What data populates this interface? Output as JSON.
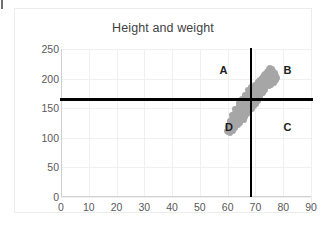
{
  "chart_data": {
    "type": "scatter",
    "title": "Height and weight",
    "xlabel": "",
    "ylabel": "",
    "xlim": [
      0,
      90
    ],
    "ylim": [
      0,
      250
    ],
    "xticks": [
      0,
      10,
      20,
      30,
      40,
      50,
      60,
      70,
      80,
      90
    ],
    "yticks": [
      0,
      50,
      100,
      150,
      200,
      250
    ],
    "grid": true,
    "legend": false,
    "marker_color": "#a6a6a6",
    "reference_lines": [
      {
        "orientation": "vertical",
        "value": 68.5,
        "color": "#000000",
        "label": "height mean"
      },
      {
        "orientation": "horizontal",
        "value": 165,
        "color": "#000000",
        "label": "weight mean"
      }
    ],
    "annotations": [
      {
        "label": "A",
        "x": 58.5,
        "y": 214,
        "quadrant": "top-left"
      },
      {
        "label": "B",
        "x": 81.5,
        "y": 214,
        "quadrant": "top-right"
      },
      {
        "label": "C",
        "x": 81.5,
        "y": 118,
        "quadrant": "bottom-right"
      },
      {
        "label": "D",
        "x": 60.5,
        "y": 118,
        "quadrant": "bottom-left"
      }
    ],
    "series": [
      {
        "name": "people",
        "points": [
          [
            59.6,
            112
          ],
          [
            60.1,
            110
          ],
          [
            60.4,
            116
          ],
          [
            60.9,
            113
          ],
          [
            60.6,
            120
          ],
          [
            61.2,
            118
          ],
          [
            61.5,
            123
          ],
          [
            61.0,
            126
          ],
          [
            61.8,
            121
          ],
          [
            62.1,
            127
          ],
          [
            61.6,
            131
          ],
          [
            62.4,
            130
          ],
          [
            62.0,
            135
          ],
          [
            62.8,
            133
          ],
          [
            62.3,
            138
          ],
          [
            63.0,
            137
          ],
          [
            62.6,
            142
          ],
          [
            63.4,
            140
          ],
          [
            63.1,
            145
          ],
          [
            63.8,
            143
          ],
          [
            63.3,
            148
          ],
          [
            64.0,
            147
          ],
          [
            63.6,
            151
          ],
          [
            64.3,
            150
          ],
          [
            64.7,
            146
          ],
          [
            64.1,
            154
          ],
          [
            64.9,
            152
          ],
          [
            64.5,
            157
          ],
          [
            65.2,
            155
          ],
          [
            65.6,
            151
          ],
          [
            65.0,
            160
          ],
          [
            65.8,
            158
          ],
          [
            65.4,
            163
          ],
          [
            66.1,
            161
          ],
          [
            66.5,
            157
          ],
          [
            65.9,
            166
          ],
          [
            66.7,
            164
          ],
          [
            66.3,
            168
          ],
          [
            67.0,
            166
          ],
          [
            67.4,
            162
          ],
          [
            66.8,
            171
          ],
          [
            67.6,
            169
          ],
          [
            67.2,
            173
          ],
          [
            67.9,
            171
          ],
          [
            68.3,
            167
          ],
          [
            67.7,
            176
          ],
          [
            68.5,
            174
          ],
          [
            68.1,
            178
          ],
          [
            68.8,
            176
          ],
          [
            69.2,
            172
          ],
          [
            68.6,
            181
          ],
          [
            69.4,
            179
          ],
          [
            69.0,
            183
          ],
          [
            69.7,
            181
          ],
          [
            70.1,
            177
          ],
          [
            69.5,
            186
          ],
          [
            70.3,
            184
          ],
          [
            69.9,
            188
          ],
          [
            70.6,
            186
          ],
          [
            71.0,
            182
          ],
          [
            70.4,
            191
          ],
          [
            71.2,
            189
          ],
          [
            70.8,
            193
          ],
          [
            71.5,
            191
          ],
          [
            71.9,
            187
          ],
          [
            71.3,
            196
          ],
          [
            72.1,
            194
          ],
          [
            71.7,
            198
          ],
          [
            72.4,
            196
          ],
          [
            72.8,
            192
          ],
          [
            72.2,
            201
          ],
          [
            73.0,
            199
          ],
          [
            72.6,
            203
          ],
          [
            73.3,
            201
          ],
          [
            73.7,
            197
          ],
          [
            73.1,
            206
          ],
          [
            73.9,
            204
          ],
          [
            73.5,
            208
          ],
          [
            74.2,
            206
          ],
          [
            74.6,
            202
          ],
          [
            74.0,
            211
          ],
          [
            74.8,
            209
          ],
          [
            74.4,
            213
          ],
          [
            75.1,
            211
          ],
          [
            75.5,
            207
          ],
          [
            74.9,
            216
          ],
          [
            75.7,
            214
          ],
          [
            75.3,
            218
          ],
          [
            76.0,
            216
          ],
          [
            76.4,
            212
          ],
          [
            76.9,
            210
          ],
          [
            77.3,
            205
          ],
          [
            77.8,
            201
          ],
          [
            76.2,
            207
          ],
          [
            75.0,
            203
          ],
          [
            73.8,
            190
          ],
          [
            72.5,
            186
          ],
          [
            71.1,
            175
          ],
          [
            70.0,
            170
          ],
          [
            68.9,
            165
          ],
          [
            67.5,
            158
          ],
          [
            66.2,
            150
          ],
          [
            65.1,
            143
          ],
          [
            64.4,
            136
          ],
          [
            63.2,
            129
          ],
          [
            62.2,
            122
          ],
          [
            61.1,
            117
          ],
          [
            60.2,
            119
          ],
          [
            62.9,
            126
          ],
          [
            64.8,
            139
          ],
          [
            66.9,
            153
          ],
          [
            68.2,
            160
          ],
          [
            69.8,
            168
          ],
          [
            71.4,
            180
          ],
          [
            72.9,
            188
          ],
          [
            74.5,
            198
          ],
          [
            76.1,
            205
          ],
          [
            77.0,
            208
          ],
          [
            75.9,
            200
          ],
          [
            74.1,
            194
          ],
          [
            72.0,
            183
          ],
          [
            70.5,
            174
          ],
          [
            69.1,
            164
          ],
          [
            67.1,
            152
          ],
          [
            65.5,
            141
          ],
          [
            63.9,
            132
          ],
          [
            62.5,
            124
          ],
          [
            61.4,
            115
          ],
          [
            60.7,
            108
          ],
          [
            61.9,
            112
          ],
          [
            63.5,
            125
          ],
          [
            65.3,
            134
          ],
          [
            67.3,
            147
          ],
          [
            69.3,
            159
          ],
          [
            71.6,
            172
          ],
          [
            73.4,
            185
          ],
          [
            75.4,
            196
          ],
          [
            76.6,
            202
          ],
          [
            77.5,
            197
          ],
          [
            76.8,
            193
          ],
          [
            75.6,
            190
          ],
          [
            74.7,
            187
          ],
          [
            73.6,
            181
          ],
          [
            72.7,
            176
          ],
          [
            71.8,
            169
          ],
          [
            70.9,
            163
          ],
          [
            70.2,
            157
          ],
          [
            69.6,
            153
          ],
          [
            68.7,
            149
          ],
          [
            67.8,
            144
          ],
          [
            67.0,
            140
          ],
          [
            66.4,
            135
          ],
          [
            65.7,
            130
          ],
          [
            64.6,
            125
          ],
          [
            63.7,
            121
          ],
          [
            62.7,
            117
          ],
          [
            61.7,
            113
          ],
          [
            60.5,
            111
          ],
          [
            68.0,
            155
          ],
          [
            69.0,
            161
          ],
          [
            70.7,
            167
          ],
          [
            72.3,
            178
          ],
          [
            73.2,
            182
          ],
          [
            74.3,
            189
          ],
          [
            75.2,
            195
          ],
          [
            76.3,
            199
          ],
          [
            77.1,
            196
          ],
          [
            68.4,
            170
          ],
          [
            69.9,
            176
          ],
          [
            71.1,
            187
          ],
          [
            72.6,
            192
          ],
          [
            70.0,
            181
          ],
          [
            68.8,
            172
          ],
          [
            67.6,
            165
          ],
          [
            66.6,
            159
          ],
          [
            65.8,
            153
          ],
          [
            64.2,
            144
          ],
          [
            63.0,
            133
          ],
          [
            61.3,
            120
          ],
          [
            66.0,
            146
          ],
          [
            67.9,
            156
          ],
          [
            69.4,
            169
          ],
          [
            71.7,
            184
          ],
          [
            73.0,
            193
          ],
          [
            74.9,
            202
          ],
          [
            76.5,
            208
          ],
          [
            75.8,
            212
          ],
          [
            74.6,
            210
          ],
          [
            73.3,
            204
          ],
          [
            72.2,
            199
          ],
          [
            71.0,
            194
          ],
          [
            69.7,
            190
          ],
          [
            68.3,
            186
          ],
          [
            67.2,
            180
          ],
          [
            66.1,
            172
          ],
          [
            65.0,
            166
          ],
          [
            64.0,
            158
          ],
          [
            62.8,
            148
          ],
          [
            61.6,
            138
          ],
          [
            60.8,
            128
          ]
        ]
      }
    ]
  }
}
